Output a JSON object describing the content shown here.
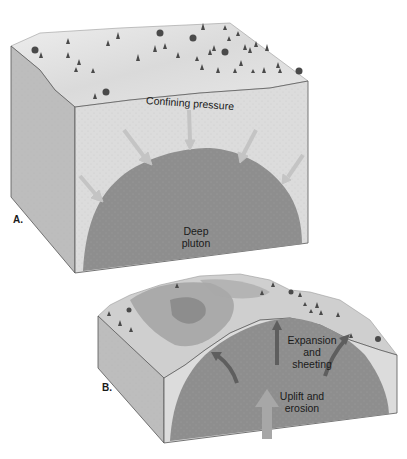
{
  "figure": {
    "panels": [
      {
        "id": "A",
        "panel_label": "A.",
        "labels": {
          "top": "Confining pressure",
          "center_line1": "Deep",
          "center_line2": "pluton"
        }
      },
      {
        "id": "B",
        "panel_label": "B.",
        "labels": {
          "upper_line1": "Expansion",
          "upper_line2": "and",
          "upper_line3": "sheeting",
          "lower_line1": "Uplift and",
          "lower_line2": "erosion"
        }
      }
    ],
    "colors": {
      "surface": "#e6e6e6",
      "front_face": "#dcdcdc",
      "side_face": "#bdbdbd",
      "pluton": "#8e8e8e",
      "arrow_light": "#c4c4c4",
      "arrow_dark": "#5e5e5e",
      "tree": "#4a4a4a",
      "outline": "#555555"
    }
  }
}
